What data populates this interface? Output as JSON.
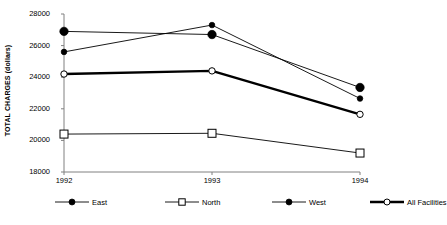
{
  "chart_data": {
    "type": "line",
    "title": "",
    "subtitle": "",
    "xlabel": "",
    "ylabel": "TOTAL CHARGES (dollars)",
    "categories": [
      "1992",
      "1993",
      "1994"
    ],
    "x_tick_labels": [
      "1992",
      "1993",
      "1994"
    ],
    "y_tick_labels": [
      "28000",
      "26000",
      "24000",
      "22000",
      "20000",
      "18000"
    ],
    "y_tick_values": [
      28000,
      26000,
      24000,
      22000,
      20000,
      18000
    ],
    "ylim": [
      18000,
      28000
    ],
    "grid": false,
    "legend_position": "bottom",
    "series": [
      {
        "name": "East",
        "values": [
          26900,
          26700,
          23350
        ],
        "marker": "filled-circle",
        "marker_size": 4.2,
        "line_width": 0.9,
        "color": "#000000"
      },
      {
        "name": "North",
        "values": [
          20400,
          20450,
          19200
        ],
        "marker": "open-square",
        "marker_size": 4.0,
        "line_width": 0.9,
        "color": "#000000"
      },
      {
        "name": "West",
        "values": [
          25600,
          27300,
          22650
        ],
        "marker": "filled-circle",
        "marker_size": 2.8,
        "line_width": 0.9,
        "color": "#000000"
      },
      {
        "name": "All Facilities",
        "values": [
          24200,
          24400,
          21650
        ],
        "marker": "open-circle",
        "marker_size": 3.2,
        "line_width": 2.4,
        "color": "#000000"
      }
    ]
  },
  "legend": {
    "items": [
      {
        "label": "East",
        "marker": "filled-circle",
        "line_width": 0.9
      },
      {
        "label": "North",
        "marker": "open-square",
        "line_width": 0.9
      },
      {
        "label": "West",
        "marker": "filled-circle",
        "line_width": 0.9
      },
      {
        "label": "All Facilities",
        "marker": "open-circle",
        "line_width": 2.4
      }
    ]
  },
  "colors": {
    "axis": "#808080",
    "plot_line": "#000000",
    "background": "#ffffff",
    "text": "#000000"
  }
}
